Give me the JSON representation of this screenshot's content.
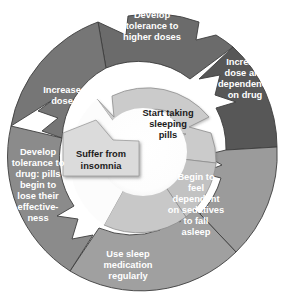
{
  "diagram": {
    "type": "cycle",
    "colors": {
      "background": "#ffffff",
      "outer_segment_darkest": "#5a5a5a",
      "outer_segment_dark": "#6e6e6e",
      "outer_segment_mid": "#7c7c7c",
      "outer_segment_light": "#8d8d8d",
      "outer_segment_lightest": "#9a9a9a",
      "inner_segment": "#c9c9c9",
      "inner_segment_alt": "#d2d2d2",
      "tab_fill": "#d9d9d9",
      "center_hole": "#fdfdfd",
      "divider": "#3d3d3d",
      "outer_text": "#ffffff",
      "inner_text": "#1a1a1a"
    },
    "outer_steps": [
      {
        "id": "develop-tolerance-higher-doses",
        "lines": [
          "Develop",
          "tolerance to",
          "higher doses"
        ],
        "fill": "#6e6e6e"
      },
      {
        "id": "increase-dose-dependence",
        "lines": [
          "Increase",
          "dose and",
          "dependence",
          "on drug"
        ],
        "fill": "#5a5a5a"
      },
      {
        "id": "begin-feel-dependent",
        "lines": [
          "Begin to",
          "feel",
          "dependent",
          "on sedatives",
          "to fall",
          "asleep"
        ],
        "fill": "#9a9a9a"
      },
      {
        "id": "use-sleep-medication-regularly",
        "lines": [
          "Use sleep",
          "medication",
          "regularly"
        ],
        "fill": "#9e9e9e"
      },
      {
        "id": "develop-tolerance-drug",
        "lines": [
          "Develop",
          "tolerance to",
          "drug: pills",
          "begin to",
          "lose their",
          "effective-",
          "ness"
        ],
        "fill": "#8a8a8a"
      },
      {
        "id": "increase-dose",
        "lines": [
          "Increase",
          "dose"
        ],
        "fill": "#787878"
      }
    ],
    "inner_steps": [
      {
        "id": "start-taking-sleeping-pills",
        "lines": [
          "Start taking",
          "sleeping",
          "pills"
        ],
        "fill": "#cccccc"
      }
    ],
    "entry_tab": {
      "id": "suffer-from-insomnia",
      "lines": [
        "Suffer from",
        "insomnia"
      ],
      "fill": "#dadada"
    }
  }
}
